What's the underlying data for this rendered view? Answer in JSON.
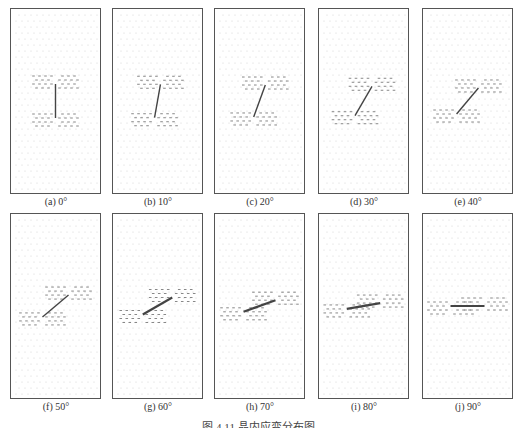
{
  "figure": {
    "caption": "图 4.11  晶内应变分布图",
    "panels": [
      {
        "label": "(a)  0°",
        "angle": 0
      },
      {
        "label": "(b)  10°",
        "angle": 10
      },
      {
        "label": "(c)  20°",
        "angle": 20
      },
      {
        "label": "(d)  30°",
        "angle": 30
      },
      {
        "label": "(e)  40°",
        "angle": 40
      },
      {
        "label": "(f)  50°",
        "angle": 50
      },
      {
        "label": "(g)  60°",
        "angle": 60
      },
      {
        "label": "(h)  70°",
        "angle": 70
      },
      {
        "label": "(i)  80°",
        "angle": 80
      },
      {
        "label": "(j)  90°",
        "angle": 90
      }
    ]
  },
  "colors": {
    "frame": "#555555",
    "grid_dot": "#c8c8c8",
    "strain_mark": "#6a6a6a",
    "crack": "#444444"
  }
}
